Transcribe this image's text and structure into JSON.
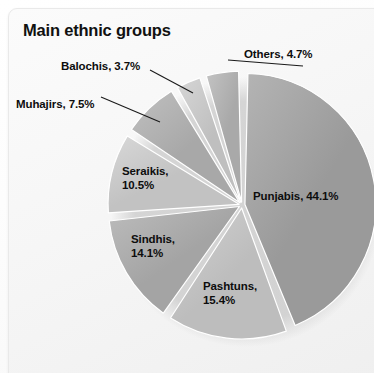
{
  "card": {
    "title": "Main ethnic groups"
  },
  "chart_data": {
    "type": "pie",
    "title": "Main ethnic groups",
    "xlabel": "",
    "ylabel": "",
    "legend_position": "none",
    "grid": false,
    "units": "percent",
    "categories": [
      "Punjabis",
      "Pashtuns",
      "Sindhis",
      "Seraikis",
      "Muhajirs",
      "Balochis",
      "Others"
    ],
    "values": [
      44.1,
      15.4,
      14.1,
      10.5,
      7.5,
      3.7,
      4.7
    ],
    "slices": [
      {
        "name": "Punjabis",
        "value": 44.1,
        "label": "Punjabis, 44.1%",
        "color": "#9a9a9a",
        "color_light": "#b4b4b4",
        "label_placement": "inside",
        "label_x": 253,
        "label_y": 190
      },
      {
        "name": "Pashtuns",
        "value": 15.4,
        "label": "Pashtuns,\n15.4%",
        "color": "#bdbdbd",
        "color_light": "#d2d2d2",
        "label_placement": "inside",
        "label_x": 203,
        "label_y": 280
      },
      {
        "name": "Sindhis",
        "value": 14.1,
        "label": "Sindhis,\n14.1%",
        "color": "#a4a4a4",
        "color_light": "#bcbcbc",
        "label_placement": "inside",
        "label_x": 131,
        "label_y": 233
      },
      {
        "name": "Seraikis",
        "value": 10.5,
        "label": "Seraikis,\n10.5%",
        "color": "#c2c2c2",
        "color_light": "#d8d8d8",
        "label_placement": "inside",
        "label_x": 122,
        "label_y": 165
      },
      {
        "name": "Muhajirs",
        "value": 7.5,
        "label": "Muhajirs, 7.5%",
        "color": "#a8a8a8",
        "color_light": "#c0c0c0",
        "label_placement": "outside",
        "label_x": 16,
        "label_y": 98
      },
      {
        "name": "Balochis",
        "value": 3.7,
        "label": "Balochis, 3.7%",
        "color": "#bfbfbf",
        "color_light": "#d6d6d6",
        "label_placement": "outside",
        "label_x": 61,
        "label_y": 60
      },
      {
        "name": "Others",
        "value": 4.7,
        "label": "Others, 4.7%",
        "color": "#a9a9a9",
        "color_light": "#c3c3c3",
        "label_placement": "outside",
        "label_x": 244,
        "label_y": 48
      }
    ],
    "geometry": {
      "center_x": 242,
      "center_y": 205,
      "radius": 131,
      "start_angle_deg": -90,
      "gap_deg": 2.6,
      "explode": 3
    },
    "leader_lines": [
      {
        "name": "others-leader",
        "x1": 303,
        "y1": 66,
        "x2": 228,
        "y2": 60
      },
      {
        "name": "balochis-leader",
        "x1": 150,
        "y1": 70,
        "x2": 193,
        "y2": 93
      },
      {
        "name": "muhajirs-leader",
        "x1": 101,
        "y1": 97,
        "x2": 160,
        "y2": 122
      }
    ]
  }
}
